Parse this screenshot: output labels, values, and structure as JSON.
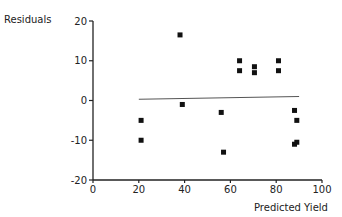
{
  "chart_data": {
    "type": "scatter",
    "title": "",
    "xlabel": "Predicted Yield",
    "ylabel": "Residuals",
    "xlim": [
      0,
      100
    ],
    "ylim": [
      -20,
      20
    ],
    "x_ticks": [
      0,
      20,
      40,
      60,
      80,
      100
    ],
    "y_ticks": [
      20,
      10,
      0,
      -10,
      -20
    ],
    "grid": false,
    "legend": null,
    "series": [
      {
        "name": "residuals",
        "marker": "square",
        "points": [
          {
            "x": 21,
            "y": -5
          },
          {
            "x": 21,
            "y": -10
          },
          {
            "x": 38,
            "y": 16.5
          },
          {
            "x": 39,
            "y": -1
          },
          {
            "x": 56,
            "y": -3
          },
          {
            "x": 57,
            "y": -13
          },
          {
            "x": 64,
            "y": 10
          },
          {
            "x": 64,
            "y": 7.5
          },
          {
            "x": 70.5,
            "y": 8.5
          },
          {
            "x": 70.5,
            "y": 7
          },
          {
            "x": 81,
            "y": 10
          },
          {
            "x": 81,
            "y": 7.5
          },
          {
            "x": 88,
            "y": -2.5
          },
          {
            "x": 89,
            "y": -5
          },
          {
            "x": 88,
            "y": -11
          },
          {
            "x": 89,
            "y": -10.5
          }
        ]
      }
    ],
    "reference_line": {
      "x": [
        20,
        90
      ],
      "y": [
        0.3,
        1.0
      ],
      "label": ""
    }
  },
  "colors": {
    "axis": "#222222",
    "marker": "#111111",
    "line": "#555555"
  }
}
